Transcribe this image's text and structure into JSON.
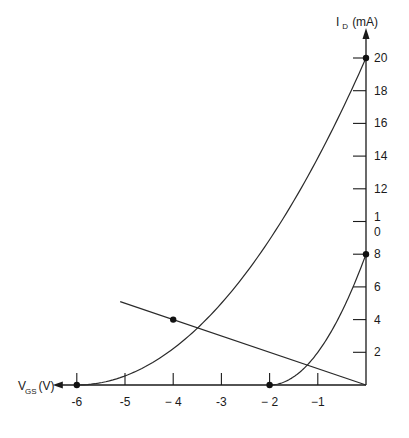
{
  "chart_data": {
    "type": "line",
    "title": "",
    "xlabel": "V_GS (V)",
    "ylabel": "I_D (mA)",
    "xlabel_main": "V",
    "xlabel_sub": "GS",
    "xlabel_unit": "(V)",
    "ylabel_main": "I",
    "ylabel_sub": "D",
    "ylabel_unit": "(mA)",
    "xlim": [
      -6,
      0
    ],
    "ylim": [
      0,
      20
    ],
    "grid": false,
    "x_ticks": [
      -6,
      -5,
      -4,
      -3,
      -2,
      -1
    ],
    "x_tick_labels": [
      "-6",
      "-5",
      "− 4",
      "-3",
      "− 2",
      "−1"
    ],
    "y_ticks": [
      2,
      4,
      6,
      8,
      10,
      12,
      14,
      16,
      18,
      20
    ],
    "y_tick_labels": [
      "2",
      "4",
      "6",
      "8",
      "1\n0",
      "12",
      "14",
      "16",
      "18",
      "20"
    ],
    "series": [
      {
        "name": "Transfer curve (IDSS=20 mA, VP=-6 V)",
        "kind": "curve",
        "IDSS": 20,
        "VP": -6,
        "x": [
          -6,
          -5,
          -4,
          -3,
          -2,
          -1,
          0
        ],
        "y": [
          0,
          0.56,
          2.22,
          5.0,
          8.89,
          13.89,
          20
        ]
      },
      {
        "name": "Transfer curve (IDSS=8 mA, VP=-2 V)",
        "kind": "curve",
        "IDSS": 8,
        "VP": -2,
        "x": [
          -2,
          -1.5,
          -1,
          -0.5,
          0
        ],
        "y": [
          0,
          0.5,
          2.0,
          4.5,
          8
        ]
      },
      {
        "name": "Bias line",
        "kind": "line",
        "x": [
          -5.1,
          -4,
          0
        ],
        "y": [
          5.1,
          4,
          0
        ]
      }
    ],
    "marked_points": [
      {
        "x": -6,
        "y": 0
      },
      {
        "x": -2,
        "y": 0
      },
      {
        "x": 0,
        "y": 20
      },
      {
        "x": 0,
        "y": 8
      },
      {
        "x": -4,
        "y": 4
      }
    ]
  }
}
